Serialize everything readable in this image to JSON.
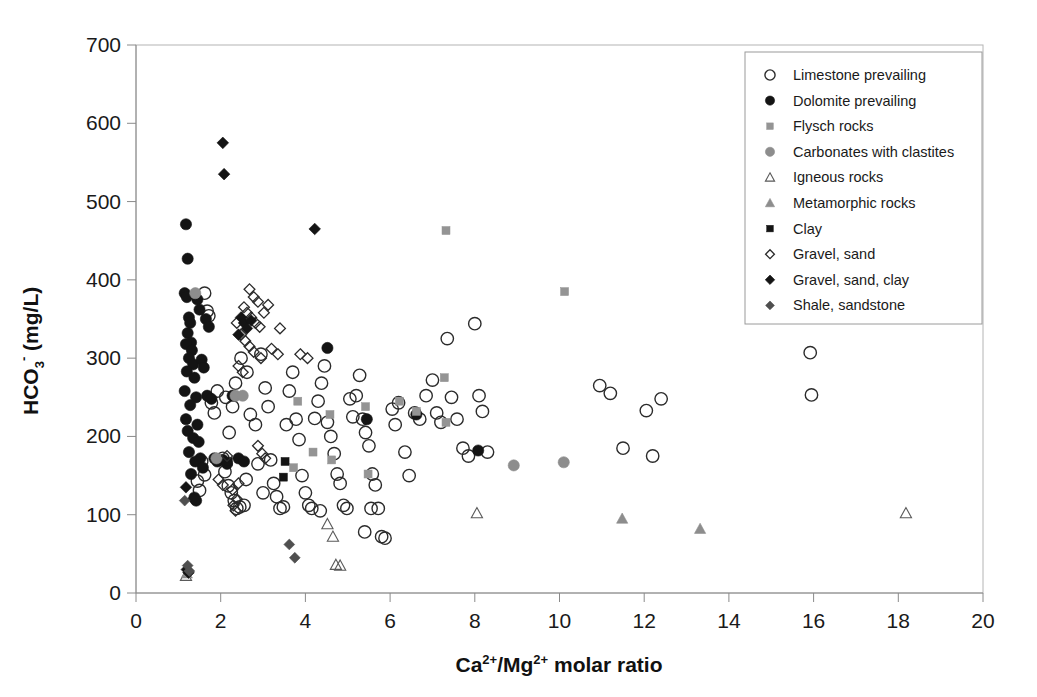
{
  "chart_data": {
    "type": "scatter",
    "title": "",
    "xlabel": "Ca2+/Mg2+ molar ratio",
    "xlabel_parts": {
      "pre": "Ca",
      "sup1": "2+",
      "mid": "/Mg",
      "sup2": "2+",
      "post": " molar ratio"
    },
    "ylabel": "HCO3- (mg/L)",
    "ylabel_parts": {
      "pre": "HCO",
      "sub": "3",
      "sup": "-",
      "post": " (mg/L)"
    },
    "xlim": [
      0,
      20
    ],
    "ylim": [
      0,
      700
    ],
    "xticks": [
      0,
      2,
      4,
      6,
      8,
      10,
      12,
      14,
      16,
      18,
      20
    ],
    "yticks": [
      0,
      100,
      200,
      300,
      400,
      500,
      600,
      700
    ],
    "xtick_labels": [
      "0",
      "2",
      "4",
      "6",
      "8",
      "10",
      "12",
      "14",
      "16",
      "18",
      "20"
    ],
    "ytick_labels": [
      "0",
      "100",
      "200",
      "300",
      "400",
      "500",
      "600",
      "700"
    ],
    "grid": false,
    "legend_position": "top-right",
    "colors": {
      "open_marker_stroke": "#2b2b2b",
      "filled_black": "#141414",
      "gray": "#8d8d8d",
      "axis": "#8a8a8a",
      "background": "#ffffff"
    },
    "series": [
      {
        "name": "Limestone prevailing",
        "marker": "open-circle",
        "color": "#2b2b2b",
        "points": [
          [
            1.62,
            383
          ],
          [
            1.68,
            360
          ],
          [
            1.72,
            354
          ],
          [
            1.55,
            168
          ],
          [
            1.62,
            151
          ],
          [
            1.45,
            143
          ],
          [
            1.5,
            131
          ],
          [
            1.78,
            243
          ],
          [
            1.85,
            230
          ],
          [
            1.92,
            258
          ],
          [
            2.05,
            172
          ],
          [
            2.1,
            155
          ],
          [
            2.18,
            137
          ],
          [
            2.25,
            128
          ],
          [
            2.32,
            118
          ],
          [
            2.38,
            108
          ],
          [
            2.45,
            110
          ],
          [
            2.55,
            112
          ],
          [
            2.12,
            250
          ],
          [
            2.28,
            238
          ],
          [
            2.35,
            268
          ],
          [
            2.48,
            300
          ],
          [
            2.62,
            282
          ],
          [
            2.7,
            228
          ],
          [
            2.82,
            215
          ],
          [
            2.95,
            305
          ],
          [
            3.05,
            262
          ],
          [
            3.12,
            238
          ],
          [
            3.18,
            170
          ],
          [
            3.25,
            140
          ],
          [
            3.32,
            123
          ],
          [
            3.4,
            108
          ],
          [
            3.48,
            110
          ],
          [
            3.55,
            215
          ],
          [
            3.62,
            258
          ],
          [
            3.7,
            282
          ],
          [
            3.78,
            222
          ],
          [
            3.85,
            196
          ],
          [
            3.92,
            150
          ],
          [
            4.0,
            128
          ],
          [
            4.08,
            112
          ],
          [
            4.15,
            108
          ],
          [
            4.22,
            223
          ],
          [
            4.3,
            245
          ],
          [
            4.38,
            268
          ],
          [
            4.45,
            290
          ],
          [
            4.52,
            218
          ],
          [
            4.6,
            200
          ],
          [
            4.68,
            178
          ],
          [
            4.75,
            152
          ],
          [
            4.82,
            140
          ],
          [
            4.9,
            112
          ],
          [
            4.98,
            108
          ],
          [
            5.05,
            248
          ],
          [
            5.12,
            225
          ],
          [
            5.2,
            252
          ],
          [
            5.28,
            278
          ],
          [
            5.35,
            222
          ],
          [
            5.42,
            205
          ],
          [
            5.5,
            188
          ],
          [
            5.58,
            152
          ],
          [
            5.65,
            138
          ],
          [
            5.72,
            108
          ],
          [
            5.8,
            72
          ],
          [
            5.88,
            70
          ],
          [
            6.05,
            235
          ],
          [
            6.12,
            215
          ],
          [
            6.2,
            243
          ],
          [
            6.35,
            180
          ],
          [
            6.45,
            150
          ],
          [
            6.58,
            230
          ],
          [
            6.7,
            222
          ],
          [
            6.85,
            252
          ],
          [
            7.0,
            272
          ],
          [
            7.1,
            230
          ],
          [
            7.2,
            218
          ],
          [
            7.35,
            325
          ],
          [
            7.45,
            250
          ],
          [
            7.58,
            222
          ],
          [
            7.72,
            185
          ],
          [
            7.85,
            175
          ],
          [
            8.0,
            344
          ],
          [
            8.1,
            252
          ],
          [
            8.18,
            232
          ],
          [
            8.3,
            180
          ],
          [
            10.95,
            265
          ],
          [
            11.2,
            255
          ],
          [
            11.5,
            185
          ],
          [
            12.05,
            233
          ],
          [
            12.4,
            248
          ],
          [
            12.2,
            175
          ],
          [
            15.92,
            307
          ],
          [
            15.95,
            253
          ],
          [
            2.88,
            165
          ],
          [
            3.0,
            128
          ],
          [
            2.2,
            205
          ],
          [
            2.6,
            145
          ],
          [
            5.55,
            108
          ],
          [
            4.35,
            105
          ],
          [
            5.4,
            78
          ]
        ]
      },
      {
        "name": "Dolomite prevailing",
        "marker": "filled-circle",
        "color": "#141414",
        "points": [
          [
            1.18,
            471
          ],
          [
            1.22,
            427
          ],
          [
            1.15,
            383
          ],
          [
            1.2,
            378
          ],
          [
            1.25,
            352
          ],
          [
            1.28,
            345
          ],
          [
            1.22,
            332
          ],
          [
            1.3,
            320
          ],
          [
            1.18,
            318
          ],
          [
            1.32,
            310
          ],
          [
            1.25,
            300
          ],
          [
            1.35,
            292
          ],
          [
            1.2,
            283
          ],
          [
            1.38,
            275
          ],
          [
            1.15,
            258
          ],
          [
            1.42,
            250
          ],
          [
            1.28,
            240
          ],
          [
            1.18,
            222
          ],
          [
            1.45,
            215
          ],
          [
            1.22,
            207
          ],
          [
            1.35,
            198
          ],
          [
            1.48,
            193
          ],
          [
            1.25,
            180
          ],
          [
            1.52,
            172
          ],
          [
            1.4,
            168
          ],
          [
            1.58,
            160
          ],
          [
            1.3,
            152
          ],
          [
            1.65,
            350
          ],
          [
            1.72,
            340
          ],
          [
            1.45,
            375
          ],
          [
            1.5,
            362
          ],
          [
            1.55,
            298
          ],
          [
            1.6,
            288
          ],
          [
            1.68,
            252
          ],
          [
            1.78,
            248
          ],
          [
            1.85,
            172
          ],
          [
            1.92,
            168
          ],
          [
            2.05,
            170
          ],
          [
            2.15,
            165
          ],
          [
            2.28,
            252
          ],
          [
            2.42,
            172
          ],
          [
            2.55,
            168
          ],
          [
            4.52,
            313
          ],
          [
            5.45,
            222
          ],
          [
            6.62,
            228
          ],
          [
            8.08,
            182
          ],
          [
            1.38,
            122
          ],
          [
            1.42,
            118
          ]
        ]
      },
      {
        "name": "Flysch rocks",
        "marker": "gray-square",
        "color": "#949494",
        "points": [
          [
            7.32,
            463
          ],
          [
            10.12,
            385
          ],
          [
            6.22,
            245
          ],
          [
            6.62,
            232
          ],
          [
            7.28,
            275
          ],
          [
            7.32,
            218
          ],
          [
            5.42,
            238
          ],
          [
            4.58,
            228
          ],
          [
            3.82,
            245
          ],
          [
            4.18,
            180
          ],
          [
            5.48,
            152
          ],
          [
            3.72,
            160
          ],
          [
            4.62,
            170
          ]
        ]
      },
      {
        "name": "Carbonates with clastites",
        "marker": "gray-circle",
        "color": "#8d8d8d",
        "points": [
          [
            1.4,
            383
          ],
          [
            2.35,
            252
          ],
          [
            2.52,
            252
          ],
          [
            8.92,
            163
          ],
          [
            10.1,
            167
          ],
          [
            1.9,
            172
          ]
        ]
      },
      {
        "name": "Igneous rocks",
        "marker": "open-triangle",
        "color": "#5a5a5a",
        "points": [
          [
            4.52,
            88
          ],
          [
            4.65,
            72
          ],
          [
            4.72,
            36
          ],
          [
            4.82,
            35
          ],
          [
            8.05,
            102
          ],
          [
            18.18,
            102
          ],
          [
            1.18,
            22
          ]
        ]
      },
      {
        "name": "Metamorphic rocks",
        "marker": "gray-triangle",
        "color": "#8d8d8d",
        "points": [
          [
            11.48,
            95
          ],
          [
            13.32,
            82
          ],
          [
            1.2,
            25
          ]
        ]
      },
      {
        "name": "Clay",
        "marker": "black-square",
        "color": "#141414",
        "points": [
          [
            2.18,
            168
          ],
          [
            3.52,
            168
          ],
          [
            3.48,
            148
          ]
        ]
      },
      {
        "name": "Gravel, sand",
        "marker": "open-diamond",
        "color": "#2b2b2b",
        "points": [
          [
            2.68,
            388
          ],
          [
            2.78,
            378
          ],
          [
            2.88,
            372
          ],
          [
            2.55,
            365
          ],
          [
            2.62,
            358
          ],
          [
            2.72,
            352
          ],
          [
            2.82,
            345
          ],
          [
            2.92,
            340
          ],
          [
            3.02,
            358
          ],
          [
            3.12,
            368
          ],
          [
            2.48,
            330
          ],
          [
            2.58,
            322
          ],
          [
            2.68,
            315
          ],
          [
            2.78,
            308
          ],
          [
            2.95,
            300
          ],
          [
            3.2,
            312
          ],
          [
            3.35,
            305
          ],
          [
            2.42,
            290
          ],
          [
            2.52,
            282
          ],
          [
            2.38,
            345
          ],
          [
            3.4,
            338
          ],
          [
            2.3,
            112
          ],
          [
            2.38,
            120
          ],
          [
            2.28,
            132
          ],
          [
            2.42,
            140
          ],
          [
            2.35,
            105
          ],
          [
            1.95,
            145
          ],
          [
            2.05,
            138
          ],
          [
            2.88,
            188
          ],
          [
            2.98,
            178
          ],
          [
            3.05,
            172
          ],
          [
            2.15,
            175
          ],
          [
            4.05,
            300
          ],
          [
            3.88,
            305
          ]
        ]
      },
      {
        "name": "Gravel, sand, clay",
        "marker": "black-diamond",
        "color": "#141414",
        "points": [
          [
            2.05,
            575
          ],
          [
            2.08,
            535
          ],
          [
            4.22,
            465
          ],
          [
            2.48,
            352
          ],
          [
            2.55,
            345
          ],
          [
            2.62,
            338
          ],
          [
            2.42,
            330
          ],
          [
            2.72,
            348
          ],
          [
            1.18,
            135
          ],
          [
            1.2,
            30
          ],
          [
            1.24,
            26
          ],
          [
            1.35,
            120
          ]
        ]
      },
      {
        "name": "Shale, sandstone",
        "marker": "darkgray-diamond",
        "color": "#4f4f4f",
        "points": [
          [
            3.62,
            62
          ],
          [
            3.75,
            45
          ],
          [
            1.22,
            35
          ],
          [
            1.26,
            28
          ],
          [
            1.15,
            118
          ]
        ]
      }
    ]
  },
  "legend": {
    "items": [
      {
        "label": "Limestone prevailing",
        "marker": "open-circle"
      },
      {
        "label": "Dolomite prevailing",
        "marker": "filled-circle"
      },
      {
        "label": "Flysch rocks",
        "marker": "gray-square"
      },
      {
        "label": "Carbonates with clastites",
        "marker": "gray-circle"
      },
      {
        "label": "Igneous rocks",
        "marker": "open-triangle"
      },
      {
        "label": "Metamorphic rocks",
        "marker": "gray-triangle"
      },
      {
        "label": "Clay",
        "marker": "black-square"
      },
      {
        "label": "Gravel, sand",
        "marker": "open-diamond"
      },
      {
        "label": "Gravel, sand, clay",
        "marker": "black-diamond"
      },
      {
        "label": "Shale, sandstone",
        "marker": "darkgray-diamond"
      }
    ]
  }
}
